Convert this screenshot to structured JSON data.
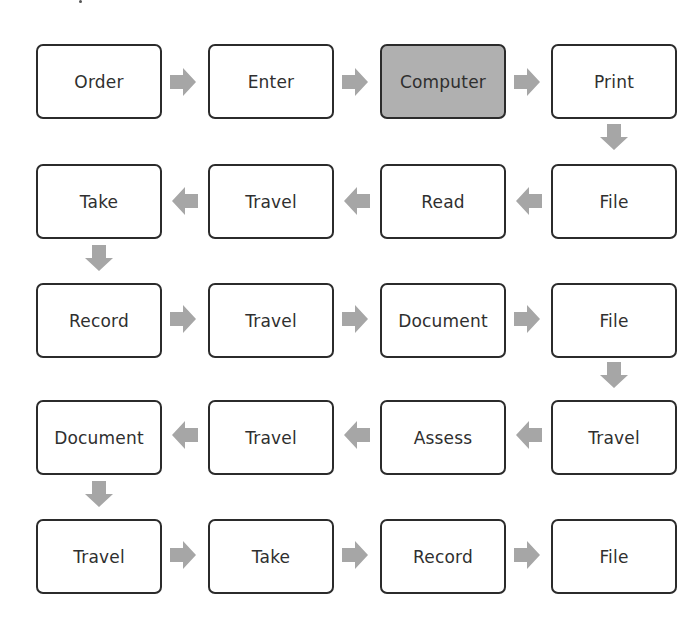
{
  "diagram": {
    "type": "process-flow",
    "arrow_color": "#a6a6a6",
    "highlight_color": "#b0b0b0",
    "rows": [
      {
        "direction": "right",
        "steps": [
          {
            "label": "Order",
            "highlight": false
          },
          {
            "label": "Enter",
            "highlight": false
          },
          {
            "label": "Computer",
            "highlight": true
          },
          {
            "label": "Print",
            "highlight": false
          }
        ]
      },
      {
        "direction": "left",
        "steps": [
          {
            "label": "Take"
          },
          {
            "label": "Travel"
          },
          {
            "label": "Read"
          },
          {
            "label": "File"
          }
        ]
      },
      {
        "direction": "right",
        "steps": [
          {
            "label": "Record"
          },
          {
            "label": "Travel"
          },
          {
            "label": "Document"
          },
          {
            "label": "File"
          }
        ]
      },
      {
        "direction": "left",
        "steps": [
          {
            "label": "Document"
          },
          {
            "label": "Travel"
          },
          {
            "label": "Assess"
          },
          {
            "label": "Travel"
          }
        ]
      },
      {
        "direction": "right",
        "steps": [
          {
            "label": "Travel"
          },
          {
            "label": "Take"
          },
          {
            "label": "Record"
          },
          {
            "label": "File"
          }
        ]
      }
    ]
  }
}
